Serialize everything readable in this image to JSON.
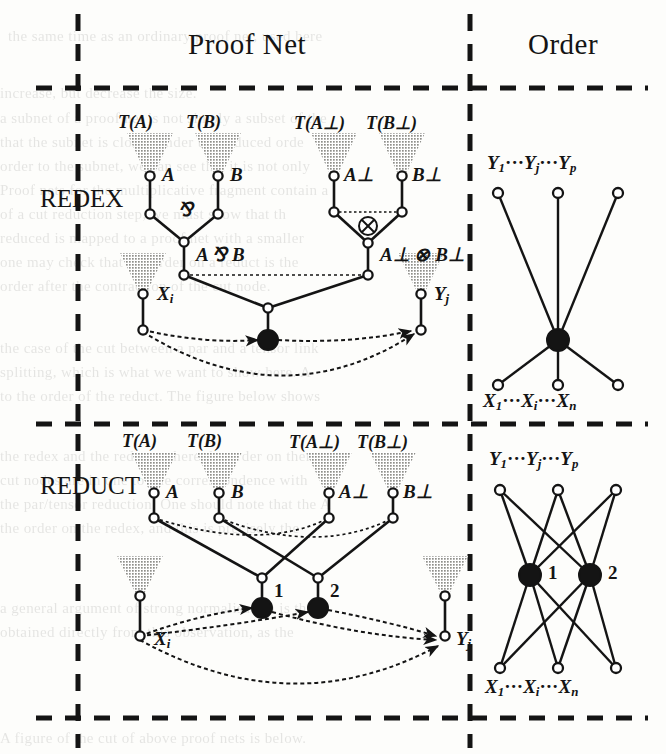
{
  "figure": {
    "title_row": {
      "proof_net": "Proof Net",
      "order": "Order"
    },
    "rows": [
      {
        "key": "redex",
        "side_label": "REDEX"
      },
      {
        "key": "reduct",
        "side_label": "REDUCT"
      }
    ]
  },
  "symbols": {
    "par": "&#8523;",
    "tensor": "&#8855;",
    "perp": "&#8869;",
    "dots": "&#183;&#183;&#183;"
  },
  "redex": {
    "proof_net": {
      "box_labels": [
        "T(A)",
        "T(B)",
        "T(A⊥)",
        "T(B⊥)"
      ],
      "atom_labels": [
        "A",
        "B",
        "A⊥",
        "B⊥"
      ],
      "par_symbol": "⅋",
      "tensor_symbol": "⊗",
      "par_formula": "A ⅋ B",
      "tensor_formula": "A⊥ ⊗ B⊥",
      "input_label": "X",
      "input_sub": "i",
      "output_label": "Y",
      "output_sub": "j",
      "cut_count": 1,
      "cut_labels": []
    },
    "order": {
      "top_label": "Y₁ ··· Yⱼ ··· Yₚ",
      "top_parts": [
        "Y",
        "1",
        "···",
        "Y",
        "j",
        "···",
        "Y",
        "p"
      ],
      "bottom_label": "X₁ ··· Xᵢ ··· Xₙ",
      "bottom_parts": [
        "X",
        "1",
        "···",
        "X",
        "i",
        "···",
        "X",
        "n"
      ],
      "hub_count": 1,
      "hub_labels": [],
      "top_nodes": 3,
      "bottom_nodes": 3
    }
  },
  "reduct": {
    "proof_net": {
      "box_labels": [
        "T(A)",
        "T(B)",
        "T(A⊥)",
        "T(B⊥)"
      ],
      "atom_labels": [
        "A",
        "B",
        "A⊥",
        "B⊥"
      ],
      "input_label": "X",
      "input_sub": "i",
      "output_label": "Y",
      "output_sub": "j",
      "cut_count": 2,
      "cut_labels": [
        "1",
        "2"
      ]
    },
    "order": {
      "top_label": "Y₁ ··· Yⱼ ··· Yₚ",
      "top_parts": [
        "Y",
        "1",
        "···",
        "Y",
        "j",
        "···",
        "Y",
        "p"
      ],
      "bottom_label": "X₁ ··· Xᵢ ··· Xₙ",
      "bottom_parts": [
        "X",
        "1",
        "···",
        "X",
        "i",
        "···",
        "X",
        "n"
      ],
      "hub_count": 2,
      "hub_labels": [
        "1",
        "2"
      ],
      "top_nodes": 3,
      "bottom_nodes": 3
    }
  },
  "colors": {
    "ink": "#141414",
    "triangle_fill": "#b9b9b5",
    "paper": "#fdfdfb"
  },
  "background_text": {
    "lines": [
      "the same time as an ordinary proof net, used here",
      "increase, but decrease the size.",
      "a subnet of a proof net is not simply a subset of the",
      "that the subnet is closed under the induced orde",
      "order to the subnet, we can see that it is not only",
      "Proof nets for the multiplicative fragment contain a",
      "of a cut reduction step, we must show that th",
      "reduced is mapped to a proof net with a smaller",
      "one may check that the order on a reduct is the",
      "order after the contraction of the cut node.",
      "the case of the cut between a par and a tensor link",
      "splitting, which is what we want to show here. A",
      "to the order of the reduct. The figure below shows",
      "the redex and the reduct, where the order on them",
      "cut nodes are in one to one correspondence with",
      "the par/tensor reduction. One should note that the A",
      "the order on the redex, and this is precisely the",
      "a general argument of strong normalisation is then",
      "obtained directly from this observation, as the",
      "A figure of the cut of above proof nets is below."
    ]
  }
}
